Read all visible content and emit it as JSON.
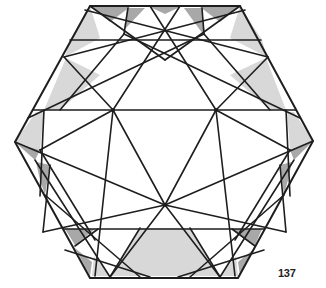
{
  "figure": {
    "page_number": "137",
    "colors": {
      "stroke": "#1e1e1e",
      "light_fill": "#d9d9d9",
      "dark_fill": "#a6a6a6",
      "background": "#ffffff"
    },
    "hexagon": [
      [
        90,
        6
      ],
      [
        240,
        6
      ],
      [
        313,
        141
      ],
      [
        238,
        278
      ],
      [
        90,
        278
      ],
      [
        15,
        142
      ]
    ],
    "key_points": {
      "upper_left_node": [
        113,
        110
      ],
      "upper_right_node": [
        216,
        110
      ],
      "lower_center_node": [
        165,
        205
      ],
      "left_upper_node": [
        64,
        57
      ],
      "right_upper_node": [
        268,
        57
      ],
      "left_lower_node": [
        43,
        232
      ],
      "right_lower_node": [
        286,
        232
      ]
    }
  }
}
